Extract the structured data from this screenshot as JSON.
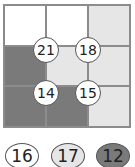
{
  "grid": {
    "rows": 3,
    "cols": 3,
    "cells": [
      [
        "white",
        "white",
        "light"
      ],
      [
        "dark",
        "light",
        "light"
      ],
      [
        "dark",
        "dark",
        "light"
      ]
    ]
  },
  "clues": [
    {
      "value": "21",
      "x": 46,
      "y": 50
    },
    {
      "value": "18",
      "x": 88,
      "y": 50
    },
    {
      "value": "14",
      "x": 46,
      "y": 93
    },
    {
      "value": "15",
      "x": 88,
      "y": 93
    }
  ],
  "options": [
    {
      "value": "16",
      "fill": "#ffffff",
      "x": 5
    },
    {
      "value": "17",
      "fill": "#e6e6e6",
      "x": 51
    },
    {
      "value": "12",
      "fill": "#7a7a7a",
      "x": 96
    }
  ],
  "colors": {
    "white": "#ffffff",
    "light": "#e6e6e6",
    "dark": "#7a7a7a"
  }
}
